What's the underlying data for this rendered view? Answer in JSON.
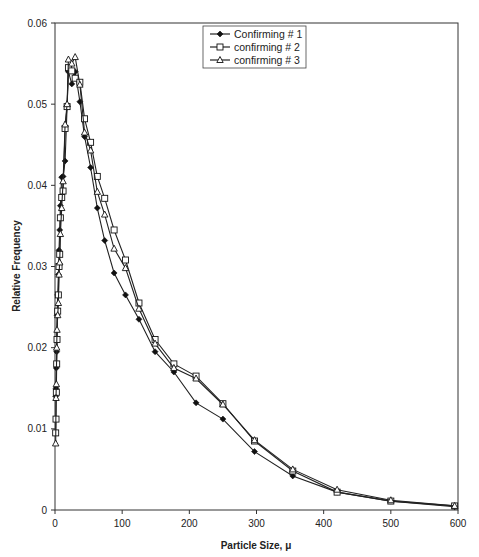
{
  "chart_data": {
    "type": "line",
    "title": "",
    "xlabel": "Particle Size, μ",
    "ylabel": "Relative Frequency",
    "xlim": [
      0,
      600
    ],
    "ylim": [
      0,
      0.06
    ],
    "x_ticks": [
      0,
      100,
      200,
      300,
      400,
      500,
      600
    ],
    "x_tick_labels": [
      "0",
      "100",
      "200",
      "300",
      "400",
      "500",
      "600"
    ],
    "y_ticks": [
      0,
      0.01,
      0.02,
      0.03,
      0.04,
      0.05,
      0.06
    ],
    "y_tick_labels": [
      "0",
      "0.01",
      "0.02",
      "0.03",
      "0.04",
      "0.05",
      "0.06"
    ],
    "grid": false,
    "legend_position": "top-center",
    "series": [
      {
        "name": "Confirming # 1",
        "marker": "filled-diamond",
        "x": [
          1,
          1.5,
          2,
          2.5,
          3,
          4,
          5,
          6,
          7,
          8,
          10,
          12,
          15,
          18,
          20,
          25,
          30,
          37,
          44,
          53,
          63,
          74,
          88,
          105,
          125,
          149,
          177,
          210,
          250,
          297,
          354,
          420,
          500,
          595
        ],
        "y": [
          0.014,
          0.015,
          0.0175,
          0.0195,
          0.024,
          0.0265,
          0.029,
          0.032,
          0.0345,
          0.0375,
          0.041,
          0.0411,
          0.043,
          0.0497,
          0.054,
          0.0525,
          0.054,
          0.0503,
          0.046,
          0.0422,
          0.0372,
          0.0332,
          0.0292,
          0.0265,
          0.0235,
          0.0195,
          0.017,
          0.0132,
          0.0112,
          0.0072,
          0.0042,
          0.0022,
          0.0011,
          0.0004
        ]
      },
      {
        "name": "confirming # 2",
        "marker": "open-square",
        "x": [
          1,
          1.5,
          2,
          2.5,
          3,
          4,
          5,
          6,
          7,
          8,
          10,
          12,
          15,
          18,
          20,
          25,
          30,
          37,
          44,
          53,
          63,
          74,
          88,
          105,
          125,
          149,
          177,
          210,
          250,
          297,
          354,
          420,
          500,
          595
        ],
        "y": [
          0.0095,
          0.0112,
          0.0145,
          0.018,
          0.021,
          0.0245,
          0.0265,
          0.03,
          0.0315,
          0.036,
          0.0385,
          0.0393,
          0.047,
          0.0497,
          0.0545,
          0.0541,
          0.0532,
          0.0527,
          0.0482,
          0.0453,
          0.0411,
          0.0384,
          0.0345,
          0.0308,
          0.0255,
          0.021,
          0.018,
          0.0165,
          0.0131,
          0.0085,
          0.0048,
          0.0022,
          0.0011,
          0.0005
        ]
      },
      {
        "name": "confirming # 3",
        "marker": "open-triangle",
        "x": [
          1,
          1.5,
          2,
          2.5,
          3,
          4,
          5,
          6,
          7,
          8,
          10,
          12,
          15,
          18,
          20,
          25,
          30,
          37,
          44,
          53,
          63,
          74,
          88,
          105,
          125,
          149,
          177,
          210,
          250,
          297,
          354,
          420,
          500,
          595
        ],
        "y": [
          0.0082,
          0.0138,
          0.0155,
          0.02,
          0.0222,
          0.024,
          0.0255,
          0.029,
          0.0305,
          0.034,
          0.0372,
          0.0405,
          0.0475,
          0.05,
          0.0555,
          0.055,
          0.0558,
          0.0524,
          0.0465,
          0.0443,
          0.0392,
          0.0364,
          0.0322,
          0.0298,
          0.0248,
          0.0205,
          0.0175,
          0.0162,
          0.013,
          0.0086,
          0.005,
          0.0025,
          0.0012,
          0.0005
        ]
      }
    ]
  },
  "legend": {
    "items": [
      "Confirming # 1",
      "confirming # 2",
      "confirming # 3"
    ]
  },
  "colors": {
    "line": "#222222",
    "axis": "#333333",
    "background": "#ffffff"
  }
}
